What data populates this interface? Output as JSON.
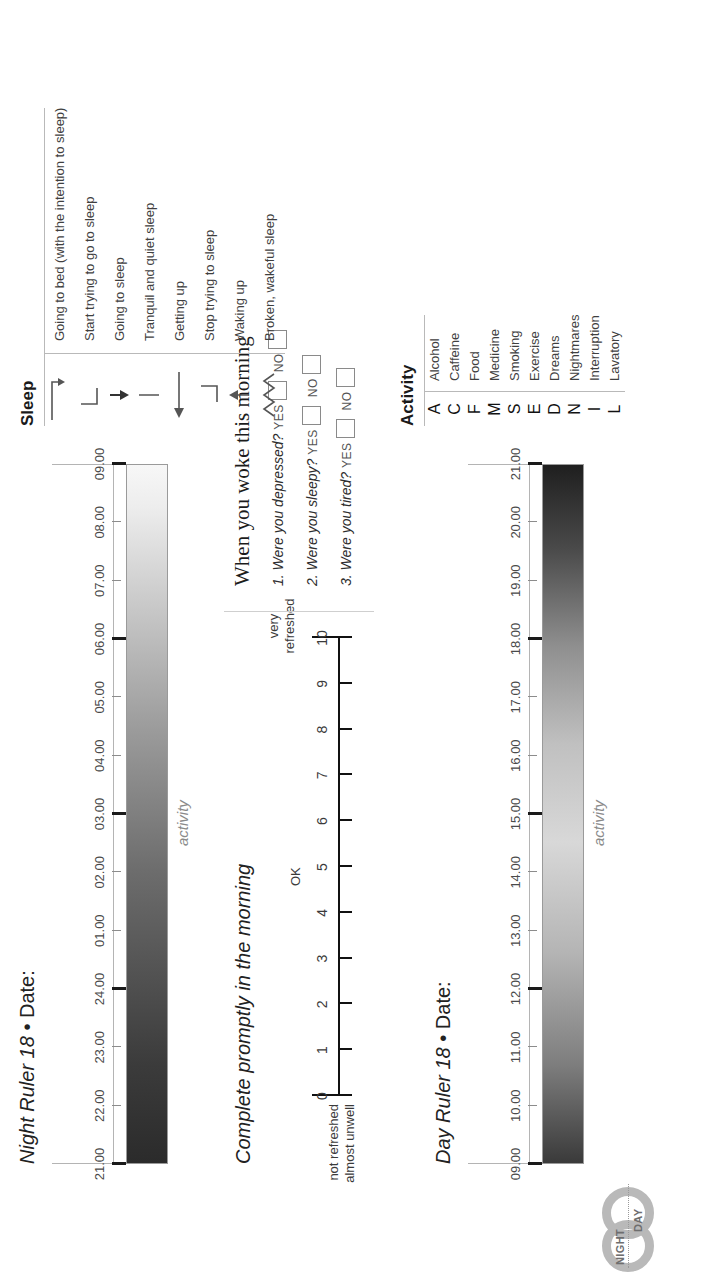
{
  "logo": {
    "night": "NIGHT",
    "day": "DAY"
  },
  "night_ruler": {
    "title_italic": "Night Ruler 18",
    "bullet": "•",
    "date_label": "Date:",
    "activity_label": "activity",
    "hours": [
      "21.00",
      "22.00",
      "23.00",
      "24.00",
      "01.00",
      "02.00",
      "03.00",
      "04.00",
      "05.00",
      "06.00",
      "07.00",
      "08.00",
      "09.00"
    ],
    "major_hours": [
      "21.00",
      "24.00",
      "03.00",
      "06.00",
      "09.00"
    ]
  },
  "day_ruler": {
    "title_italic": "Day Ruler 18",
    "bullet": "•",
    "date_label": "Date:",
    "activity_label": "activity",
    "hours": [
      "09.00",
      "10.00",
      "11.00",
      "12.00",
      "13.00",
      "14.00",
      "15.00",
      "16.00",
      "17.00",
      "18.00",
      "19.00",
      "20.00",
      "21.00"
    ],
    "major_hours": [
      "09.00",
      "12.00",
      "15.00",
      "18.00",
      "21.00"
    ]
  },
  "morning_scale": {
    "title": "Complete promptly in the morning",
    "numbers": [
      "0",
      "1",
      "2",
      "3",
      "4",
      "5",
      "6",
      "7",
      "8",
      "9",
      "10"
    ],
    "anchor_low_line1": "not refreshed",
    "anchor_low_line2": "almost unwell",
    "anchor_mid": "OK",
    "anchor_high_line1": "very",
    "anchor_high_line2": "refreshed"
  },
  "questionnaire": {
    "title": "When you woke this morning",
    "yes_label": "YES",
    "no_label": "NO",
    "questions": [
      {
        "num": "1.",
        "text": "Were you depressed?"
      },
      {
        "num": "2.",
        "text": "Were you sleepy?"
      },
      {
        "num": "3.",
        "text": "Were you tired?"
      }
    ]
  },
  "sleep_legend": {
    "title": "Sleep",
    "rows": [
      {
        "symbol": "arrow-down-right-icon",
        "label": "Going to bed (with the intention to sleep)"
      },
      {
        "symbol": "bracket-left-icon",
        "label": "Start trying to go to sleep"
      },
      {
        "symbol": "arrow-down-icon",
        "label": "Going to sleep"
      },
      {
        "symbol": "vertical-line-icon",
        "label": "Tranquil and quiet sleep"
      },
      {
        "symbol": "arrow-left-icon",
        "label": "Getting up"
      },
      {
        "symbol": "bracket-right-icon",
        "label": "Stop trying to sleep"
      },
      {
        "symbol": "arrow-up-icon",
        "label": "Waking up"
      },
      {
        "symbol": "zigzag-icon",
        "label": "Broken, wakeful sleep"
      }
    ]
  },
  "activity_legend": {
    "title": "Activity",
    "rows": [
      {
        "code": "A",
        "label": "Alcohol"
      },
      {
        "code": "C",
        "label": "Caffeine"
      },
      {
        "code": "F",
        "label": "Food"
      },
      {
        "code": "M",
        "label": "Medicine"
      },
      {
        "code": "S",
        "label": "Smoking"
      },
      {
        "code": "E",
        "label": "Exercise"
      },
      {
        "code": "D",
        "label": "Dreams"
      },
      {
        "code": "N",
        "label": "Nightmares"
      },
      {
        "code": "I",
        "label": "Interruption"
      },
      {
        "code": "L",
        "label": "Lavatory"
      }
    ]
  }
}
